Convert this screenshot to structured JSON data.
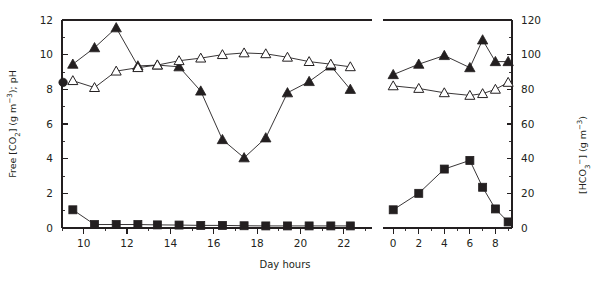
{
  "figure": {
    "background_color": "#ffffff",
    "ink_color": "#231f20",
    "xlabel": "Day hours"
  },
  "chart_data": {
    "type": "line",
    "title": "",
    "subtitle": "",
    "xlabel": "Day hours",
    "ylabel": "Free [CO₂] (g m⁻³); pH",
    "ylabel_right": "[HCO₃⁻] (g m⁻³)",
    "grid": false,
    "legend": "none",
    "panels": [
      {
        "name": "day-panel",
        "xlim": [
          9.0,
          23.3
        ],
        "xticks": [
          10,
          12,
          14,
          16,
          18,
          20,
          22
        ],
        "xtick_labels": [
          "10",
          "12",
          "14",
          "16",
          "18",
          "20",
          "22"
        ],
        "xminor_step": 1,
        "ylim": [
          0,
          12
        ],
        "yticks": [
          0,
          2,
          4,
          6,
          8,
          10,
          12
        ],
        "ytick_labels": [
          "0",
          "2",
          "4",
          "6",
          "8",
          "10",
          "12"
        ],
        "yminor_step": 1,
        "ylim_right": [
          0,
          120
        ],
        "series": [
          {
            "name": "pH",
            "marker": "filled-triangle",
            "axis": "left",
            "x": [
              9.5,
              10.5,
              11.5,
              12.5,
              13.4,
              14.4,
              15.4,
              16.4,
              17.4,
              18.4,
              19.4,
              20.4,
              21.4,
              22.3
            ],
            "values": [
              9.45,
              10.4,
              11.55,
              9.35,
              9.4,
              9.3,
              7.9,
              5.1,
              4.05,
              5.2,
              7.8,
              8.45,
              9.35,
              8.0
            ]
          },
          {
            "name": "HCO3-",
            "marker": "open-triangle",
            "axis": "right",
            "x": [
              9.5,
              10.5,
              11.5,
              12.5,
              13.4,
              14.4,
              15.4,
              16.4,
              17.4,
              18.4,
              19.4,
              20.4,
              21.4,
              22.3
            ],
            "values": [
              85,
              81,
              90.5,
              92.5,
              94,
              96.5,
              98,
              100,
              101,
              100.5,
              98.5,
              96,
              94.5,
              93
            ]
          },
          {
            "name": "Free CO2",
            "marker": "filled-square",
            "axis": "left",
            "x": [
              9.5,
              10.5,
              11.5,
              12.5,
              13.4,
              14.4,
              15.4,
              16.4,
              17.4,
              18.4,
              19.4,
              20.4,
              21.4,
              22.3
            ],
            "values": [
              1.05,
              0.2,
              0.2,
              0.2,
              0.18,
              0.17,
              0.15,
              0.15,
              0.13,
              0.12,
              0.12,
              0.12,
              0.12,
              0.12
            ]
          },
          {
            "name": "initial-pH-point",
            "marker": "filled-circle",
            "axis": "left",
            "x": [
              9.05
            ],
            "values": [
              8.4
            ]
          }
        ]
      },
      {
        "name": "night-panel",
        "xlim": [
          -0.8,
          9.3
        ],
        "xticks": [
          0,
          2,
          4,
          6,
          8
        ],
        "xtick_labels": [
          "0",
          "2",
          "4",
          "6",
          "8"
        ],
        "xminor_step": 1,
        "ylim": [
          0,
          12
        ],
        "yticks": [
          0,
          2,
          4,
          6,
          8,
          10,
          12
        ],
        "ytick_labels": [
          "0",
          "20",
          "40",
          "60",
          "80",
          "100",
          "120"
        ],
        "yminor_step": 1,
        "ylim_right": [
          0,
          120
        ],
        "series": [
          {
            "name": "pH",
            "marker": "filled-triangle",
            "axis": "left",
            "x": [
              0,
              2,
              4,
              6,
              7,
              8,
              9
            ],
            "values": [
              8.85,
              9.45,
              9.95,
              9.25,
              10.85,
              9.6,
              9.6
            ]
          },
          {
            "name": "HCO3-",
            "marker": "open-triangle",
            "axis": "right",
            "x": [
              0,
              2,
              4,
              6,
              7,
              8,
              9
            ],
            "values": [
              82,
              80.5,
              78,
              76.5,
              77.5,
              80,
              84
            ]
          },
          {
            "name": "Free CO2",
            "marker": "filled-square",
            "axis": "left",
            "x": [
              0,
              2,
              4,
              6,
              7,
              8,
              9
            ],
            "values": [
              1.05,
              2.0,
              3.4,
              3.9,
              2.35,
              1.1,
              0.35
            ]
          }
        ]
      }
    ]
  }
}
